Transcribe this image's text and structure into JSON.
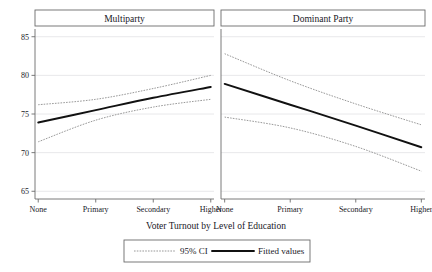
{
  "chart_data": {
    "type": "line",
    "title": "",
    "xlabel": "Voter Turnout by Level of Education",
    "ylabel": "",
    "ylim": [
      64,
      86
    ],
    "yticks": [
      65,
      70,
      75,
      80,
      85
    ],
    "ytick_labels": [
      "65",
      "70",
      "75",
      "80",
      "85"
    ],
    "grid": true,
    "categories": [
      "None",
      "Primary",
      "Secondary",
      "Higher"
    ],
    "x": [
      0,
      1,
      2,
      3
    ],
    "legend": {
      "position": "bottom",
      "entries": [
        {
          "label": "95% CI",
          "style": "dashed",
          "color": "#8d8d8d"
        },
        {
          "label": "Fitted values",
          "style": "solid",
          "color": "#111111"
        }
      ]
    },
    "panels": [
      {
        "title": "Multiparty",
        "series": [
          {
            "name": "Fitted values",
            "style": "solid",
            "color": "#111111",
            "values": [
              73.9,
              75.5,
              77.1,
              78.5
            ]
          },
          {
            "name": "95% CI upper",
            "style": "dashed",
            "color": "#8d8d8d",
            "values": [
              76.2,
              76.9,
              78.3,
              80.0
            ]
          },
          {
            "name": "95% CI lower",
            "style": "dashed",
            "color": "#8d8d8d",
            "values": [
              71.4,
              74.2,
              75.9,
              76.9
            ]
          }
        ]
      },
      {
        "title": "Dominant Party",
        "series": [
          {
            "name": "Fitted values",
            "style": "solid",
            "color": "#111111",
            "values": [
              78.9,
              76.2,
              73.5,
              70.7
            ]
          },
          {
            "name": "95% CI upper",
            "style": "dashed",
            "color": "#8d8d8d",
            "values": [
              82.8,
              79.3,
              76.3,
              73.6
            ]
          },
          {
            "name": "95% CI lower",
            "style": "dashed",
            "color": "#8d8d8d",
            "values": [
              74.6,
              73.2,
              70.8,
              67.6
            ]
          }
        ]
      }
    ]
  },
  "colors": {
    "frame": "#6b6b6b",
    "grid": "#e2e2e4",
    "fit": "#111111",
    "ci": "#8d8d8d",
    "text": "#20201f",
    "background": "#ffffff"
  }
}
